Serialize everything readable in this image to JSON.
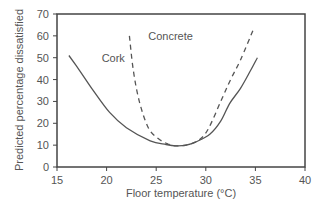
{
  "chart_data": {
    "type": "line",
    "title": "",
    "xlabel": "Floor temperature (°C)",
    "ylabel": "Predicted percentage dissatisfied",
    "xlim": [
      15,
      40
    ],
    "ylim": [
      0,
      70
    ],
    "xticks": [
      15,
      20,
      25,
      30,
      35,
      40
    ],
    "yticks": [
      0,
      10,
      20,
      30,
      40,
      50,
      60,
      70
    ],
    "grid": false,
    "legend": "inline labels",
    "series": [
      {
        "name": "Cork",
        "style": "solid",
        "color": "#555555",
        "label_pos": [
          19.5,
          48
        ],
        "x": [
          16.2,
          17.3,
          18.5,
          20.3,
          22.0,
          24.4,
          26.0,
          27.0,
          28.0,
          29.0,
          30.4,
          31.5,
          32.4,
          33.5,
          34.5,
          35.2
        ],
        "y": [
          51,
          44,
          36,
          25,
          18,
          12,
          10.3,
          9.7,
          10,
          11.5,
          15,
          21,
          29,
          36,
          44,
          50
        ]
      },
      {
        "name": "Concrete",
        "style": "dashed",
        "color": "#555555",
        "label_pos": [
          24.2,
          58
        ],
        "x": [
          22.3,
          22.7,
          23.3,
          24.2,
          25.2,
          26.2,
          27.0,
          28.0,
          29.2,
          30.2,
          31.6,
          32.5,
          33.5,
          34.8
        ],
        "y": [
          60,
          44,
          30,
          18,
          13,
          10.5,
          9.7,
          10,
          12,
          17,
          31,
          40,
          49,
          63
        ]
      }
    ]
  },
  "axes": {
    "xlabel": "Floor temperature (°C)",
    "ylabel": "Predicted percentage dissatisfied",
    "xtick_labels": [
      "15",
      "20",
      "25",
      "30",
      "35",
      "40"
    ],
    "ytick_labels": [
      "0",
      "10",
      "20",
      "30",
      "40",
      "50",
      "60",
      "70"
    ]
  },
  "labels": {
    "cork": "Cork",
    "concrete": "Concrete"
  },
  "colors": {
    "frame": "#444444",
    "curve": "#555555",
    "text": "#555555"
  }
}
